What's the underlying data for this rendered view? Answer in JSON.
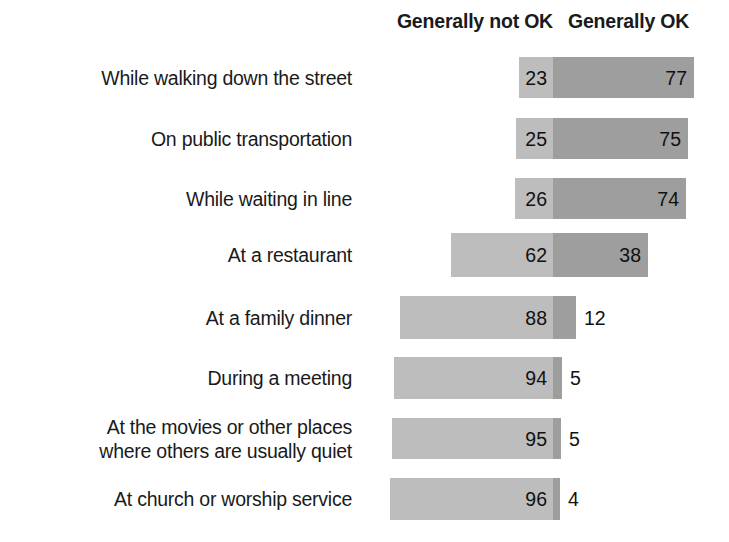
{
  "legend": {
    "not_ok": "Generally not OK",
    "ok": "Generally OK"
  },
  "chart_data": {
    "type": "bar",
    "subtype": "diverging-stacked-bar",
    "title": "",
    "subtitle": "",
    "xlabel": "",
    "ylabel": "",
    "grid": false,
    "legend_position": "top",
    "legend_entries": [
      "Generally not OK",
      "Generally OK"
    ],
    "colors": {
      "not_ok": "#bdbdbd",
      "ok": "#9e9e9e",
      "text": "#1a1a1a",
      "background": "#ffffff"
    },
    "categories": [
      "While walking down the street",
      "On public transportation",
      "While waiting in line",
      "At a restaurant",
      "At a family dinner",
      "During a meeting",
      "At the movies or other places\nwhere others are usually quiet",
      "At church or worship service"
    ],
    "series": [
      {
        "name": "Generally not OK",
        "values": [
          23,
          25,
          26,
          62,
          88,
          94,
          95,
          96
        ]
      },
      {
        "name": "Generally OK",
        "values": [
          77,
          75,
          74,
          38,
          12,
          5,
          5,
          4
        ]
      }
    ],
    "value_suffix": "",
    "xlim": [
      0,
      100
    ]
  },
  "rows": [
    {
      "label": "While walking down the street",
      "not_ok": "23",
      "ok": "77",
      "geom": {
        "top": 57,
        "height": 41,
        "left_x": 519,
        "divider_x": 553,
        "right_x": 694,
        "ok_outside": false
      }
    },
    {
      "label": "On public transportation",
      "not_ok": "25",
      "ok": "75",
      "geom": {
        "top": 118,
        "height": 41,
        "left_x": 516,
        "divider_x": 553,
        "right_x": 688,
        "ok_outside": false
      }
    },
    {
      "label": "While waiting in line",
      "not_ok": "26",
      "ok": "74",
      "geom": {
        "top": 178,
        "height": 41,
        "left_x": 515,
        "divider_x": 553,
        "right_x": 686,
        "ok_outside": false
      }
    },
    {
      "label": "At a restaurant",
      "not_ok": "62",
      "ok": "38",
      "geom": {
        "top": 233,
        "height": 44,
        "left_x": 451,
        "divider_x": 553,
        "right_x": 648,
        "ok_outside": false
      }
    },
    {
      "label": "At a family dinner",
      "not_ok": "88",
      "ok": "12",
      "geom": {
        "top": 296,
        "height": 43,
        "left_x": 400,
        "divider_x": 553,
        "right_x": 576,
        "ok_outside": true
      }
    },
    {
      "label": "During a meeting",
      "not_ok": "94",
      "ok": "5",
      "geom": {
        "top": 357,
        "height": 42,
        "left_x": 394,
        "divider_x": 553,
        "right_x": 562,
        "ok_outside": true
      }
    },
    {
      "label": "At the movies or other places\nwhere others are usually quiet",
      "not_ok": "95",
      "ok": "5",
      "geom": {
        "top": 418,
        "height": 41,
        "left_x": 392,
        "divider_x": 553,
        "right_x": 561,
        "ok_outside": true
      }
    },
    {
      "label": "At church or worship service",
      "not_ok": "96",
      "ok": "4",
      "geom": {
        "top": 478,
        "height": 42,
        "left_x": 390,
        "divider_x": 553,
        "right_x": 560,
        "ok_outside": true
      }
    }
  ]
}
